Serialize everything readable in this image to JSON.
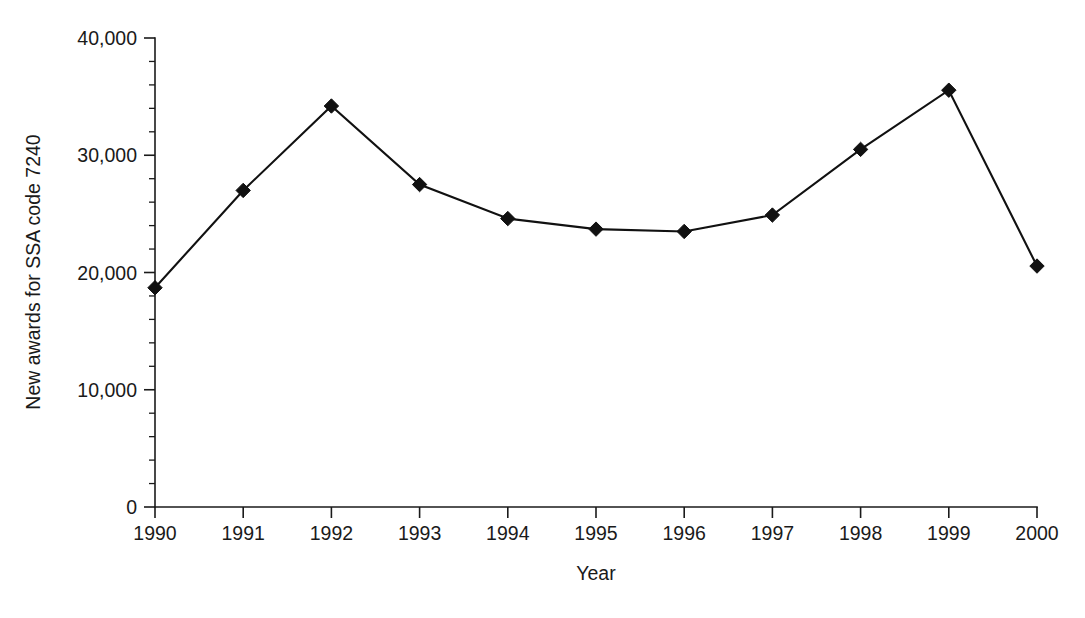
{
  "chart_data": {
    "type": "line",
    "title": "",
    "xlabel": "Year",
    "ylabel": "New awards for SSA code 7240",
    "x": [
      1990,
      1991,
      1992,
      1993,
      1994,
      1995,
      1996,
      1997,
      1998,
      1999,
      2000
    ],
    "categories": [
      "1990",
      "1991",
      "1992",
      "1993",
      "1994",
      "1995",
      "1996",
      "1997",
      "1998",
      "1999",
      "2000"
    ],
    "values": [
      18700,
      27000,
      34200,
      27500,
      24600,
      23700,
      23500,
      24900,
      30500,
      35550,
      20550
    ],
    "series": [
      {
        "name": "New awards for SSA code 7240",
        "values": [
          18700,
          27000,
          34200,
          27500,
          24600,
          23700,
          23500,
          24900,
          30500,
          35550,
          20550
        ]
      }
    ],
    "ylim": [
      0,
      40000
    ],
    "xlim": [
      1990,
      2000
    ],
    "y_major_ticks": [
      0,
      10000,
      20000,
      30000,
      40000
    ],
    "y_tick_labels": [
      "0",
      "10,000",
      "20,000",
      "30,000",
      "40,000"
    ],
    "y_minor_interval": 2000,
    "x_tick_labels": [
      "1990",
      "1991",
      "1992",
      "1993",
      "1994",
      "1995",
      "1996",
      "1997",
      "1998",
      "1999",
      "2000"
    ],
    "grid": false,
    "legend": false,
    "legend_position": "none",
    "marker": "diamond",
    "line_color": "#111111",
    "marker_color": "#111111",
    "axis_color": "#1a1a1a",
    "background_color": "#ffffff"
  }
}
